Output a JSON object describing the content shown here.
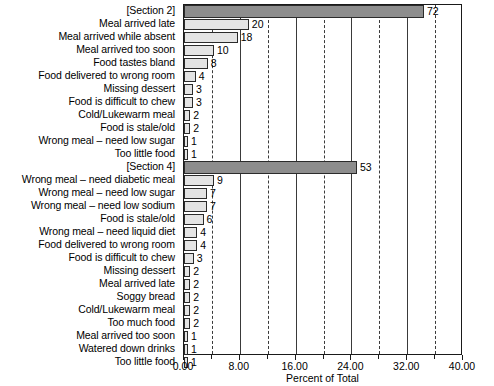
{
  "chart_data": {
    "type": "bar",
    "orientation": "horizontal",
    "title": "",
    "xlabel": "Percent of Total",
    "ylabel": "",
    "xlim": [
      0.0,
      40.0
    ],
    "grid": true,
    "grid_major_step": 8.0,
    "grid_minor_step": 4.0,
    "legend": "none",
    "value_label_note": "Bars are annotated with raw counts; the x axis is Percent of Total.",
    "xticks": [
      "0.00",
      "8.00",
      "16.00",
      "24.00",
      "32.00",
      "40.00"
    ],
    "xtick_values": [
      0,
      8,
      16,
      24,
      32,
      40
    ],
    "categories": [
      "[Section 2]",
      "Meal arrived late",
      "Meal arrived while absent",
      "Meal arrived too soon",
      "Food tastes bland",
      "Food delivered to wrong room",
      "Missing dessert",
      "Food is difficult to chew",
      "Cold/Lukewarm meal",
      "Food is stale/old",
      "Wrong meal – need low sugar",
      "Too little food",
      "[Section 4]",
      "Wrong meal – need diabetic meal",
      "Wrong meal – need low sugar",
      "Wrong meal – need low sodium",
      "Food is stale/old",
      "Wrong meal – need liquid diet",
      "Food delivered to wrong room",
      "Food is difficult to chew",
      "Missing dessert",
      "Meal arrived late",
      "Soggy bread",
      "Cold/Lukewarm meal",
      "Too much food",
      "Meal arrived too soon",
      "Watered down drinks",
      "Too little food"
    ],
    "counts": [
      72,
      20,
      18,
      10,
      8,
      4,
      3,
      3,
      2,
      2,
      1,
      1,
      53,
      9,
      7,
      7,
      6,
      4,
      4,
      3,
      2,
      2,
      2,
      2,
      2,
      1,
      1,
      1
    ],
    "values": [
      34.4,
      9.3,
      7.7,
      4.3,
      3.4,
      1.7,
      1.3,
      1.3,
      0.9,
      0.9,
      0.4,
      0.4,
      24.8,
      4.3,
      3.3,
      3.3,
      2.8,
      1.9,
      1.9,
      1.4,
      0.9,
      0.9,
      0.9,
      0.9,
      0.9,
      0.4,
      0.4,
      0.4
    ],
    "is_section": [
      true,
      false,
      false,
      false,
      false,
      false,
      false,
      false,
      false,
      false,
      false,
      false,
      true,
      false,
      false,
      false,
      false,
      false,
      false,
      false,
      false,
      false,
      false,
      false,
      false,
      false,
      false,
      false
    ],
    "series_name": "Count of complaints",
    "colors": {
      "section_bar": "#8d8d8d",
      "category_bar": "#e4e4e4",
      "bar_border": "#2b2b2b",
      "gridline": "#3a3a3a",
      "axis": "#1a1a1a",
      "background": "#ffffff",
      "text": "#000000"
    }
  }
}
